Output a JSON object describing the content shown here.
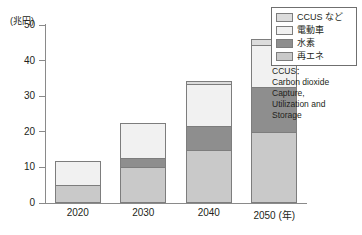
{
  "chart_data": {
    "type": "bar",
    "stacked": true,
    "title": "",
    "xlabel": "(年)",
    "ylabel": "(兆円)",
    "ylim": [
      0,
      50
    ],
    "yticks": [
      0,
      10,
      20,
      30,
      40,
      50
    ],
    "ytick_labels": [
      "0",
      "10",
      "20",
      "30",
      "40",
      "50"
    ],
    "categories": [
      "2020",
      "2030",
      "2040",
      "2050"
    ],
    "grid": false,
    "legend_position": "top-right",
    "series": [
      {
        "name": "再エネ",
        "color": "#c9c9c9",
        "values": [
          5,
          10,
          15,
          20
        ]
      },
      {
        "name": "水素",
        "color": "#8e8e8e",
        "values": [
          0,
          3,
          7,
          13
        ]
      },
      {
        "name": "電動車",
        "color": "#f1f1f1",
        "values": [
          7,
          10,
          12,
          12
        ]
      },
      {
        "name": "CCUS など",
        "color": "#dcdcdc",
        "values": [
          0,
          0,
          1,
          2
        ]
      }
    ],
    "totals": [
      12,
      23,
      35,
      47
    ]
  },
  "axis": {
    "unit_label": "(兆円)",
    "x_unit_label": "(年)"
  },
  "legend": {
    "items": [
      {
        "label": "CCUS など"
      },
      {
        "label": "電動車"
      },
      {
        "label": "水素"
      },
      {
        "label": "再エネ"
      }
    ]
  },
  "note": {
    "text": "CCUS：\nCarbon dioxide Capture, Utilization and Storage",
    "line1": "CCUS：",
    "line2": "Carbon dioxide",
    "line3": "Capture,",
    "line4": "Utilization and",
    "line5": "Storage"
  },
  "footnote": {
    "text": ""
  },
  "colors": {
    "axis": "#8a8a8a",
    "segment_border": "#7d7d7d",
    "reene": "#c9c9c9",
    "suiso": "#8e8e8e",
    "dendosha": "#f1f1f1",
    "ccus": "#dcdcdc",
    "text": "#231f20"
  }
}
